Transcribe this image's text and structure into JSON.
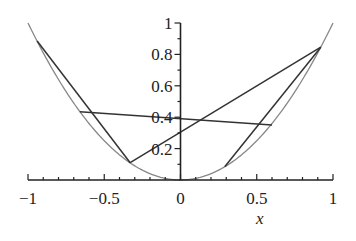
{
  "chart_data": {
    "type": "line",
    "title": "",
    "xlabel": "x",
    "ylabel": "",
    "xlim": [
      -1,
      1
    ],
    "ylim": [
      0,
      1
    ],
    "grid": false,
    "legend": null,
    "x_ticks": [
      "-1",
      "-0.5",
      "0",
      "0.5",
      "1"
    ],
    "y_ticks": [
      "0.2",
      "0.4",
      "0.6",
      "0.8",
      "1"
    ],
    "series": [
      {
        "name": "parabola y = x^2",
        "color": "#888888",
        "function": "x^2",
        "x_range": [
          -1,
          1
        ]
      },
      {
        "name": "chord-left-to-bottom",
        "color": "#333333",
        "points": [
          [
            -0.94,
            0.885
          ],
          [
            -0.33,
            0.11
          ]
        ]
      },
      {
        "name": "chord-bottom-to-right",
        "color": "#333333",
        "points": [
          [
            -0.33,
            0.11
          ],
          [
            0.92,
            0.846
          ]
        ]
      },
      {
        "name": "chord-right-to-lowright",
        "color": "#333333",
        "points": [
          [
            0.92,
            0.846
          ],
          [
            0.29,
            0.084
          ]
        ]
      },
      {
        "name": "secant-horizontal",
        "color": "#333333",
        "points": [
          [
            -0.66,
            0.435
          ],
          [
            0.6,
            0.35
          ]
        ]
      }
    ]
  },
  "labels": {
    "x_ticks": [
      {
        "text": "−1",
        "value": -1
      },
      {
        "text": "−0.5",
        "value": -0.5
      },
      {
        "text": "0",
        "value": 0
      },
      {
        "text": "0.5",
        "value": 0.5
      },
      {
        "text": "1",
        "value": 1
      }
    ],
    "y_ticks": [
      {
        "text": "0.2",
        "value": 0.2
      },
      {
        "text": "0.4",
        "value": 0.4
      },
      {
        "text": "0.6",
        "value": 0.6
      },
      {
        "text": "0.8",
        "value": 0.8
      },
      {
        "text": "1",
        "value": 1
      }
    ],
    "x_axis_title": "x"
  }
}
